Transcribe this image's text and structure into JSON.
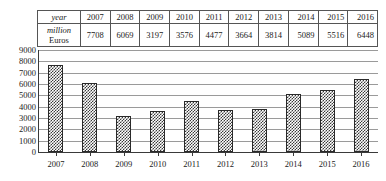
{
  "table": {
    "row_labels": [
      "year",
      "million Euros"
    ],
    "row_label_1": "year",
    "row_label_2_line1": "million",
    "row_label_2_line2": "Euros",
    "years": [
      "2007",
      "2008",
      "2009",
      "2010",
      "2011",
      "2012",
      "2013",
      "2014",
      "2015",
      "2016"
    ],
    "values": [
      "7708",
      "6069",
      "3197",
      "3576",
      "4477",
      "3664",
      "3814",
      "5089",
      "5516",
      "6448"
    ]
  },
  "chart_data": {
    "type": "bar",
    "title": "",
    "xlabel": "",
    "ylabel": "",
    "categories": [
      "2007",
      "2008",
      "2009",
      "2010",
      "2011",
      "2012",
      "2013",
      "2014",
      "2015",
      "2016"
    ],
    "values": [
      7708,
      6069,
      3197,
      3576,
      4477,
      3664,
      3814,
      5089,
      5516,
      6448
    ],
    "ylim": [
      0,
      9000
    ],
    "ytick_values": [
      0,
      1000,
      2000,
      3000,
      4000,
      5000,
      6000,
      7000,
      8000,
      9000
    ],
    "ytick_labels": [
      "0",
      "1000",
      "2000",
      "3000",
      "4000",
      "5000",
      "6000",
      "7000",
      "8000",
      "9000"
    ],
    "grid": true,
    "legend": "none",
    "series": [
      {
        "name": "million Euros",
        "values": [
          7708,
          6069,
          3197,
          3576,
          4477,
          3664,
          3814,
          5089,
          5516,
          6448
        ]
      }
    ]
  },
  "colors": {
    "bar_pattern": "#3a3a3a",
    "bar_background": "#ffffff",
    "gridline": "#9a9a9a",
    "axis": "#3a3a3a",
    "text": "#1a1a1a",
    "table_border": "#555555"
  }
}
